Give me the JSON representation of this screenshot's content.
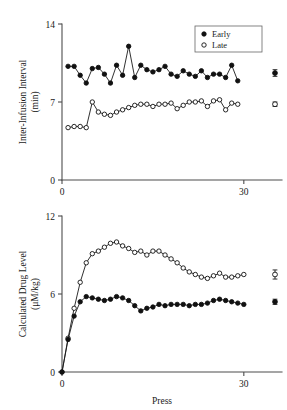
{
  "figure": {
    "background": "#ffffff",
    "ink_color": "#1a1a1a",
    "axis_color": "#4d4d4d"
  },
  "legend": {
    "position": "top-right",
    "entries": [
      {
        "label": "Early",
        "marker": "filled-circle"
      },
      {
        "label": "Late",
        "marker": "open-circle"
      }
    ]
  },
  "chart_data": [
    {
      "panel": "top",
      "type": "line",
      "title": "",
      "xlabel": "",
      "ylabel": "Inter-Infusion Interval (min)",
      "ylabel_line1": "Inter-Infusion Interval",
      "ylabel_line2": "(min)",
      "xlim": [
        0,
        33
      ],
      "ylim": [
        0,
        14
      ],
      "xticks": [
        0,
        30
      ],
      "xticklabels": [
        "0",
        "30"
      ],
      "yticks": [
        0,
        7,
        14
      ],
      "yticklabels": [
        "0",
        "7",
        "14"
      ],
      "grid": false,
      "x": [
        1,
        2,
        3,
        4,
        5,
        6,
        7,
        8,
        9,
        10,
        11,
        12,
        13,
        14,
        15,
        16,
        17,
        18,
        19,
        20,
        21,
        22,
        23,
        24,
        25,
        26,
        27,
        28,
        29
      ],
      "series": [
        {
          "name": "Early",
          "marker": "filled-circle",
          "values": [
            10.2,
            10.2,
            9.4,
            8.7,
            10.0,
            10.1,
            9.5,
            8.7,
            10.3,
            9.4,
            12.0,
            9.2,
            10.3,
            9.9,
            9.7,
            9.9,
            10.2,
            9.5,
            9.3,
            9.8,
            9.5,
            9.3,
            9.8,
            9.2,
            9.5,
            9.5,
            9.2,
            10.3,
            8.9
          ],
          "mean_marker": {
            "value": 9.6,
            "sem": 0.3
          }
        },
        {
          "name": "Late",
          "marker": "open-circle",
          "values": [
            4.7,
            4.8,
            4.8,
            4.7,
            7.0,
            6.1,
            5.9,
            5.8,
            6.1,
            6.3,
            6.5,
            6.7,
            6.8,
            6.8,
            6.6,
            6.8,
            6.8,
            6.9,
            6.4,
            6.7,
            7.0,
            7.0,
            7.1,
            6.6,
            7.1,
            7.2,
            6.3,
            6.9,
            6.8
          ],
          "mean_marker": {
            "value": 6.8,
            "sem": 0.2
          }
        }
      ]
    },
    {
      "panel": "bottom",
      "type": "line",
      "title": "",
      "xlabel": "Press",
      "ylabel": "Calculated Drug Level (μM/kg)",
      "ylabel_line1": "Calculated Drug Level",
      "ylabel_line2": "(μM/kg)",
      "xlim": [
        0,
        33
      ],
      "ylim": [
        0,
        12
      ],
      "xticks": [
        0,
        30
      ],
      "xticklabels": [
        "0",
        "30"
      ],
      "yticks": [
        0,
        6,
        12
      ],
      "yticklabels": [
        "0",
        "6",
        "12"
      ],
      "grid": false,
      "x": [
        0,
        1,
        2,
        3,
        4,
        5,
        6,
        7,
        8,
        9,
        10,
        11,
        12,
        13,
        14,
        15,
        16,
        17,
        18,
        19,
        20,
        21,
        22,
        23,
        24,
        25,
        26,
        27,
        28,
        29,
        30
      ],
      "series": [
        {
          "name": "Late",
          "marker": "open-circle",
          "values": [
            0.0,
            2.6,
            4.9,
            6.9,
            8.4,
            9.1,
            9.3,
            9.6,
            9.9,
            10.0,
            9.7,
            9.5,
            9.2,
            9.3,
            9.0,
            9.3,
            9.3,
            9.0,
            8.7,
            8.4,
            8.0,
            7.7,
            7.5,
            7.3,
            7.2,
            7.4,
            7.6,
            7.3,
            7.3,
            7.4,
            7.5
          ],
          "mean_marker": {
            "value": 7.5,
            "sem": 0.35
          }
        },
        {
          "name": "Early",
          "marker": "filled-circle",
          "values": [
            0.0,
            2.5,
            4.3,
            5.4,
            5.8,
            5.7,
            5.6,
            5.5,
            5.6,
            5.8,
            5.7,
            5.5,
            5.1,
            4.7,
            4.9,
            5.0,
            5.2,
            5.1,
            5.2,
            5.2,
            5.2,
            5.1,
            5.2,
            5.2,
            5.3,
            5.5,
            5.6,
            5.5,
            5.4,
            5.3,
            5.2
          ],
          "mean_marker": {
            "value": 5.4,
            "sem": 0.2
          }
        }
      ]
    }
  ]
}
